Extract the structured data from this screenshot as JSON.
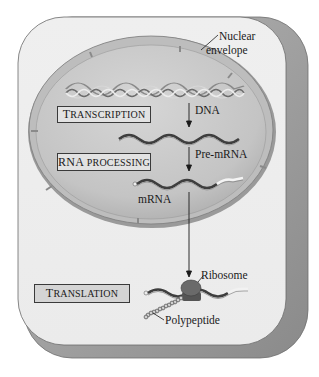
{
  "diagram": {
    "labels": {
      "nuclear_envelope_line1": "Nuclear",
      "nuclear_envelope_line2": "envelope",
      "dna": "DNA",
      "pre_mrna": "Pre-mRNA",
      "mrna": "mRNA",
      "ribosome": "Ribosome",
      "polypeptide": "Polypeptide"
    },
    "process_boxes": [
      {
        "first": "T",
        "rest": "RANSCRIPTION",
        "full": "Transcription"
      },
      {
        "first": "RNA",
        "rest": " PROCESSING",
        "full": "RNA processing"
      },
      {
        "first": "T",
        "rest": "RANSLATION",
        "full": "Translation"
      }
    ],
    "colors": {
      "cell_face": "#ededed",
      "cell_side": "#9a9a9a",
      "nucleus_fill": "#c8c8c8",
      "envelope": "#8c8c8c",
      "box_fill": "#d4d4d4",
      "ink": "#1a1a1a"
    }
  }
}
